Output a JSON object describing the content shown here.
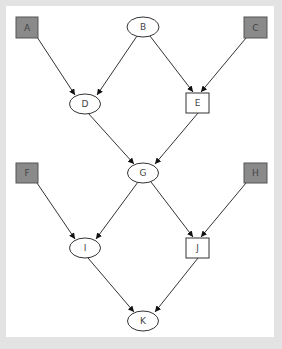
{
  "diagram": {
    "type": "directed-graph",
    "colors": {
      "background_frame": "#e3e3e3",
      "canvas": "#ffffff",
      "observed_fill": "#8a8a8a",
      "stroke": "#333333",
      "label": "#444444"
    },
    "nodes": [
      {
        "id": "A",
        "label": "A",
        "shape": "box",
        "filled": true
      },
      {
        "id": "B",
        "label": "B",
        "shape": "ellipse",
        "filled": false
      },
      {
        "id": "C",
        "label": "C",
        "shape": "box",
        "filled": true
      },
      {
        "id": "D",
        "label": "D",
        "shape": "ellipse",
        "filled": false
      },
      {
        "id": "E",
        "label": "E",
        "shape": "box",
        "filled": false
      },
      {
        "id": "F",
        "label": "F",
        "shape": "box",
        "filled": true
      },
      {
        "id": "G",
        "label": "G",
        "shape": "ellipse",
        "filled": false
      },
      {
        "id": "H",
        "label": "H",
        "shape": "box",
        "filled": true
      },
      {
        "id": "I",
        "label": "I",
        "shape": "ellipse",
        "filled": false
      },
      {
        "id": "J",
        "label": "J",
        "shape": "box",
        "filled": false
      },
      {
        "id": "K",
        "label": "K",
        "shape": "ellipse",
        "filled": false
      }
    ],
    "edges": [
      {
        "from": "A",
        "to": "D"
      },
      {
        "from": "B",
        "to": "D"
      },
      {
        "from": "B",
        "to": "E"
      },
      {
        "from": "C",
        "to": "E"
      },
      {
        "from": "D",
        "to": "G"
      },
      {
        "from": "E",
        "to": "G"
      },
      {
        "from": "F",
        "to": "I"
      },
      {
        "from": "G",
        "to": "I"
      },
      {
        "from": "G",
        "to": "J"
      },
      {
        "from": "H",
        "to": "J"
      },
      {
        "from": "I",
        "to": "K"
      },
      {
        "from": "J",
        "to": "K"
      }
    ]
  }
}
